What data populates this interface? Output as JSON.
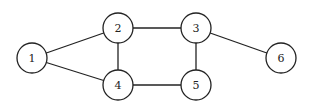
{
  "diagram": {
    "type": "undirected-graph",
    "node_radius": 15,
    "colors": {
      "stroke": "#222222",
      "fill": "#ffffff",
      "background": "#ffffff"
    },
    "nodes": [
      {
        "id": "1",
        "label": "1",
        "x": 32,
        "y": 58
      },
      {
        "id": "2",
        "label": "2",
        "x": 118,
        "y": 28
      },
      {
        "id": "3",
        "label": "3",
        "x": 196,
        "y": 28
      },
      {
        "id": "4",
        "label": "4",
        "x": 118,
        "y": 85
      },
      {
        "id": "5",
        "label": "5",
        "x": 196,
        "y": 85
      },
      {
        "id": "6",
        "label": "6",
        "x": 281,
        "y": 58
      }
    ],
    "edges": [
      {
        "from": "1",
        "to": "2"
      },
      {
        "from": "1",
        "to": "4"
      },
      {
        "from": "2",
        "to": "3"
      },
      {
        "from": "2",
        "to": "4"
      },
      {
        "from": "4",
        "to": "5"
      },
      {
        "from": "3",
        "to": "5"
      },
      {
        "from": "3",
        "to": "6"
      }
    ]
  }
}
